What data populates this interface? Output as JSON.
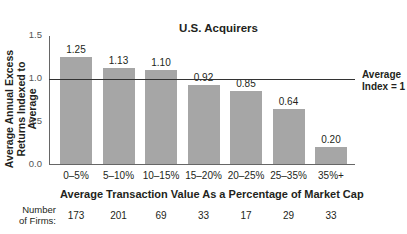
{
  "chart_data": {
    "type": "bar",
    "title": "U.S. Acquirers",
    "xlabel": "Average Transaction Value As a Percentage of Market Cap",
    "ylabel": "Average Annual Excess Returns Indexed to Average",
    "categories": [
      "0–5%",
      "5–10%",
      "10–15%",
      "15–20%",
      "20–25%",
      "25–35%",
      "35%+"
    ],
    "values": [
      1.25,
      1.13,
      1.1,
      0.92,
      0.85,
      0.64,
      0.2
    ],
    "value_labels": [
      "1.25",
      "1.13",
      "1.10",
      "0.92",
      "0.85",
      "0.64",
      "0.20"
    ],
    "ylim": [
      0,
      1.5
    ],
    "yticks": [
      "1.5",
      "1.0",
      "0.5",
      "0.0"
    ],
    "reference_line": {
      "value": 1.0,
      "label_line1": "Average",
      "label_line2": "Index = 1"
    },
    "grid": false,
    "bar_color": "#a6a6a6",
    "number_of_firms": {
      "label_line1": "Number",
      "label_line2": "of Firms:",
      "values": [
        "173",
        "201",
        "69",
        "33",
        "17",
        "29",
        "33"
      ]
    }
  }
}
